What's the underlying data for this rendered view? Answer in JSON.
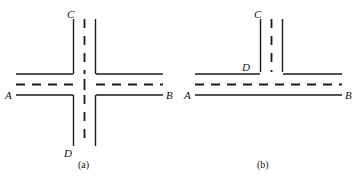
{
  "figure": {
    "type": "line-diagram",
    "background_color": "#ffffff",
    "line_color": "#1a1a1a",
    "panels": [
      {
        "id": "a",
        "caption": "(a)",
        "intersection_type": "four-way-cross",
        "labels": {
          "top": "C",
          "bottom": "D",
          "left": "A",
          "right": "B"
        },
        "horizontal_road": {
          "name": "road-AB",
          "edge_top_y": 74,
          "edge_bottom_y": 95,
          "center_dash_y": 84,
          "x_start": 16,
          "x_end": 163
        },
        "vertical_road": {
          "name": "road-CD",
          "edge_left_x": 73,
          "edge_right_x": 96,
          "center_dash_x": 84,
          "y_start": 19,
          "y_end": 146
        }
      },
      {
        "id": "b",
        "caption": "(b)",
        "intersection_type": "t-junction",
        "labels": {
          "top": "C",
          "junction": "D",
          "left": "A",
          "right": "B"
        },
        "horizontal_road": {
          "name": "road-AB",
          "edge_top_y": 74,
          "edge_bottom_y": 95,
          "center_dash_y": 84,
          "x_start": 16,
          "x_end": 163
        },
        "vertical_road": {
          "name": "road-CD",
          "edge_left_x": 81,
          "edge_right_x": 104,
          "center_dash_x": 92,
          "y_start": 19,
          "y_end": 72
        }
      }
    ],
    "stroke_width": 1.4,
    "dash_pattern": "9 7"
  }
}
